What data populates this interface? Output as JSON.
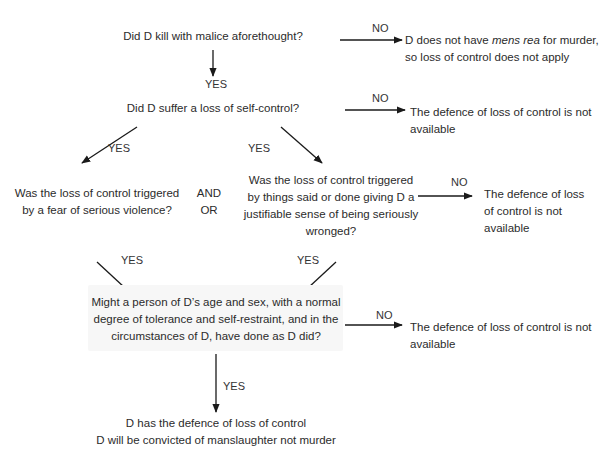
{
  "diagram": {
    "type": "flowchart",
    "nodes": {
      "q1": {
        "lines": [
          "Did D kill with malice aforethought?"
        ]
      },
      "r1": {
        "lines_pre": "D does not have ",
        "lines_italic": "mens rea",
        "lines_post": " for murder,",
        "line2": "so loss of control does not apply"
      },
      "q2": {
        "lines": [
          "Did D suffer a loss of self-control?"
        ]
      },
      "r2": {
        "lines": [
          "The defence of loss of control is not",
          "available"
        ]
      },
      "q3a": {
        "lines": [
          "Was the loss of control triggered",
          "by a fear of serious violence?"
        ]
      },
      "conj": {
        "lines": [
          "AND",
          "OR"
        ]
      },
      "q3b": {
        "lines": [
          "Was the loss of control triggered",
          "by things said or done giving D a",
          "justifiable sense of being seriously",
          "wronged?"
        ]
      },
      "r3": {
        "lines": [
          "The defence of loss",
          "of control is not",
          "available"
        ]
      },
      "q4": {
        "lines": [
          "Might a person of D’s age and sex, with a normal",
          "degree of tolerance and self-restraint, and in the",
          "circumstances of D, have done as D did?"
        ]
      },
      "r4": {
        "lines": [
          "The defence of loss of control is not",
          "available"
        ]
      },
      "final": {
        "lines": [
          "D has the defence of loss of control",
          "D will be convicted of manslaughter not murder"
        ]
      }
    },
    "edge_labels": {
      "q1_no": "NO",
      "q1_yes": "YES",
      "q2_no": "NO",
      "q2_yes_left": "YES",
      "q2_yes_right": "YES",
      "q3b_no": "NO",
      "q3a_yes": "YES",
      "q3b_yes": "YES",
      "q4_no": "NO",
      "q4_yes": "YES"
    },
    "colors": {
      "text": "#2b2b2b",
      "arrow": "#1a1a1a",
      "box": "#f7f7f7",
      "background": "#ffffff"
    }
  }
}
